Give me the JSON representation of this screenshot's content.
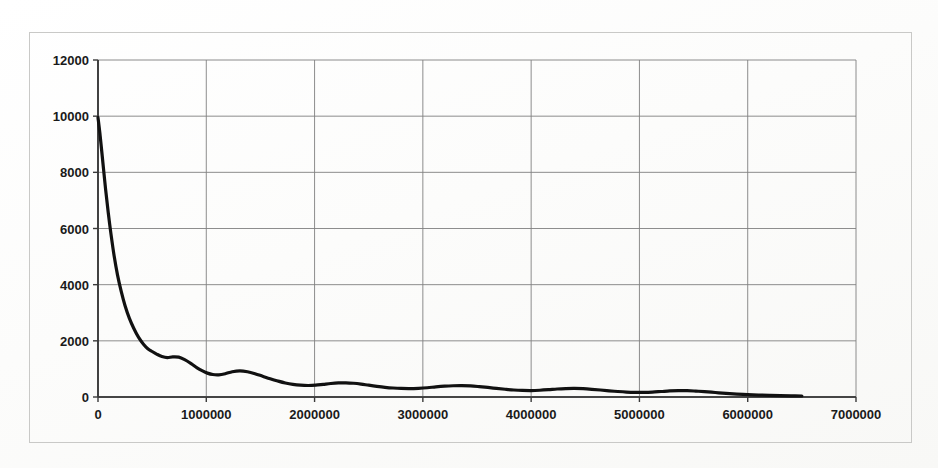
{
  "figure": {
    "background_color": "#fdfdfc",
    "border_color": "#c9c9c7",
    "plot_area": {
      "left_px": 98,
      "right_px": 856,
      "top_px": 60,
      "bottom_px": 397
    }
  },
  "chart_data": {
    "type": "line",
    "title": "",
    "subtitle": "",
    "xlabel": "",
    "ylabel": "",
    "xlim": [
      0,
      7000000
    ],
    "ylim": [
      0,
      12000
    ],
    "xticks": [
      0,
      1000000,
      2000000,
      3000000,
      4000000,
      5000000,
      6000000,
      7000000
    ],
    "xtick_labels": [
      "0",
      "1000000",
      "2000000",
      "3000000",
      "4000000",
      "5000000",
      "6000000",
      "7000000"
    ],
    "yticks": [
      0,
      2000,
      4000,
      6000,
      8000,
      10000,
      12000
    ],
    "ytick_labels": [
      "0",
      "2000",
      "4000",
      "6000",
      "8000",
      "10000",
      "12000"
    ],
    "grid": true,
    "grid_color": "#808080",
    "legend": null,
    "legend_position": "none",
    "annotations": [],
    "series": [
      {
        "name": "decay",
        "color": "#111111",
        "line_width": 3.2,
        "marker": "none",
        "x": [
          0,
          20000,
          45000,
          70000,
          95000,
          120000,
          150000,
          180000,
          215000,
          250000,
          290000,
          330000,
          375000,
          420000,
          460000,
          500000,
          545000,
          590000,
          640000,
          690000,
          745000,
          800000,
          860000,
          915000,
          965000,
          1010000,
          1060000,
          1115000,
          1175000,
          1240000,
          1310000,
          1380000,
          1450000,
          1520000,
          1590000,
          1660000,
          1730000,
          1800000,
          1870000,
          1940000,
          2010000,
          2080000,
          2150000,
          2220000,
          2290000,
          2360000,
          2430000,
          2500000,
          2575000,
          2650000,
          2725000,
          2800000,
          2880000,
          2960000,
          3040000,
          3120000,
          3200000,
          3280000,
          3360000,
          3440000,
          3520000,
          3600000,
          3680000,
          3760000,
          3840000,
          3920000,
          4000000,
          4080000,
          4160000,
          4240000,
          4320000,
          4400000,
          4480000,
          4560000,
          4640000,
          4720000,
          4800000,
          4880000,
          4960000,
          5040000,
          5120000,
          5200000,
          5280000,
          5360000,
          5440000,
          5520000,
          5600000,
          5700000,
          5800000,
          5900000,
          6000000,
          6100000,
          6200000,
          6300000,
          6400000,
          6500000
        ],
        "y": [
          9950,
          9300,
          8350,
          7400,
          6550,
          5800,
          5000,
          4350,
          3750,
          3250,
          2800,
          2450,
          2120,
          1880,
          1720,
          1620,
          1520,
          1440,
          1400,
          1430,
          1420,
          1330,
          1190,
          1040,
          930,
          850,
          800,
          790,
          830,
          900,
          930,
          900,
          830,
          740,
          650,
          570,
          500,
          450,
          420,
          410,
          420,
          450,
          480,
          500,
          505,
          490,
          460,
          420,
          380,
          345,
          320,
          305,
          300,
          310,
          330,
          360,
          385,
          400,
          405,
          395,
          370,
          340,
          305,
          275,
          250,
          235,
          230,
          240,
          260,
          285,
          300,
          305,
          295,
          275,
          250,
          220,
          195,
          175,
          165,
          165,
          175,
          195,
          215,
          225,
          225,
          210,
          190,
          160,
          130,
          105,
          85,
          70,
          58,
          48,
          40,
          35
        ]
      }
    ]
  }
}
